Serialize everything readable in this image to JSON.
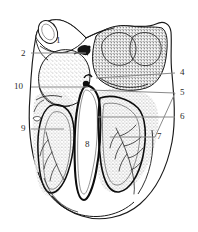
{
  "figure": {
    "background_color": "#ffffff",
    "ink_color": "#1a1a1a",
    "leader_color": "#8a8a8a",
    "label_color": "#2b2b2b",
    "stipple_color": "#3a3a3a"
  },
  "labels": [
    {
      "id": "1",
      "text": "1",
      "x": 56,
      "y": 36,
      "side": "inner-top-left"
    },
    {
      "id": "2",
      "text": "2",
      "x": 21,
      "y": 50,
      "side": "left"
    },
    {
      "id": "4",
      "text": "4",
      "x": 180,
      "y": 70,
      "side": "right"
    },
    {
      "id": "5",
      "text": "5",
      "x": 180,
      "y": 90,
      "side": "right"
    },
    {
      "id": "6",
      "text": "6",
      "x": 180,
      "y": 114,
      "side": "right"
    },
    {
      "id": "7",
      "text": "7",
      "x": 157,
      "y": 134,
      "side": "right"
    },
    {
      "id": "8",
      "text": "8",
      "x": 87,
      "y": 143,
      "side": "center"
    },
    {
      "id": "9",
      "text": "9",
      "x": 21,
      "y": 126,
      "side": "left"
    },
    {
      "id": "10",
      "text": "10",
      "x": 16,
      "y": 84,
      "side": "left"
    }
  ],
  "leaders": [
    {
      "for": "2",
      "x1": 31,
      "y1": 53,
      "x2": 86,
      "y2": 53
    },
    {
      "for": "10",
      "x1": 31,
      "y1": 87,
      "x2": 88,
      "y2": 87
    },
    {
      "for": "9",
      "x1": 31,
      "y1": 129,
      "x2": 64,
      "y2": 129
    },
    {
      "for": "4",
      "x1": 175,
      "y1": 73,
      "x2": 96,
      "y2": 78
    },
    {
      "for": "5",
      "x1": 175,
      "y1": 93,
      "x2": 90,
      "y2": 90
    },
    {
      "for": "6",
      "x1": 175,
      "y1": 117,
      "x2": 98,
      "y2": 117
    },
    {
      "for": "7",
      "x1": 155,
      "y1": 137,
      "x2": 110,
      "y2": 137
    }
  ],
  "structures": [
    {
      "name": "great-vessel-stump",
      "region": "top-left"
    },
    {
      "name": "vessel-orifice",
      "region": "top-left-rim"
    },
    {
      "name": "auricle-right",
      "region": "top-right"
    },
    {
      "name": "atrial-mass-left",
      "region": "mid-left"
    },
    {
      "name": "interventricular-septum",
      "region": "center"
    },
    {
      "name": "ventricular-cavity-left",
      "region": "center-left"
    },
    {
      "name": "ventricular-cavity-right",
      "region": "center-right"
    },
    {
      "name": "coronary-branches",
      "region": "lower-right"
    },
    {
      "name": "coronary-branches-left",
      "region": "lower-left"
    },
    {
      "name": "apex",
      "region": "bottom"
    }
  ]
}
